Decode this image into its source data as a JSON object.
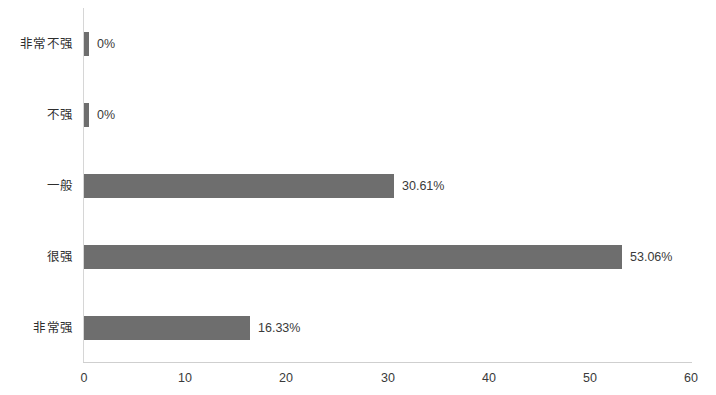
{
  "chart_data": {
    "type": "bar",
    "orientation": "horizontal",
    "title": "",
    "subtitle": "",
    "xlabel": "",
    "ylabel": "",
    "categories": [
      "非常不强",
      "不强",
      "一般",
      "很强",
      "非常强"
    ],
    "values": [
      0,
      0,
      30.61,
      53.06,
      16.33
    ],
    "value_labels": [
      "0%",
      "0%",
      "30.61%",
      "53.06%",
      "16.33%"
    ],
    "series": [
      {
        "name": "",
        "values": [
          0,
          0,
          30.61,
          53.06,
          16.33
        ]
      }
    ],
    "xlim": [
      0,
      60
    ],
    "xticks": [
      0,
      10,
      20,
      30,
      40,
      50,
      60
    ],
    "xtick_labels": [
      "0",
      "10",
      "20",
      "30",
      "40",
      "50",
      "60"
    ],
    "grid": false,
    "legend": false,
    "legend_position": "none",
    "bar_color": "#6e6e6e",
    "axis_color": "#d6d6d6",
    "text_color": "#3a3a3a",
    "background_color": "#ffffff"
  },
  "axis": {
    "ticks": [
      {
        "label": "0",
        "x": 84
      },
      {
        "label": "10",
        "x": 185
      },
      {
        "label": "20",
        "x": 286
      },
      {
        "label": "30",
        "x": 388
      },
      {
        "label": "40",
        "x": 489
      },
      {
        "label": "50",
        "x": 590
      },
      {
        "label": "60",
        "x": 691
      }
    ]
  },
  "rows": [
    {
      "label": "非常不强",
      "value_label": "0%",
      "bar_width_px": 5,
      "top": 14,
      "bar_top": 32
    },
    {
      "label": "不强",
      "value_label": "0%",
      "bar_width_px": 5,
      "top": 85,
      "bar_top": 103
    },
    {
      "label": "一般",
      "value_label": "30.61%",
      "bar_width_px": 310,
      "top": 156,
      "bar_top": 174
    },
    {
      "label": "很强",
      "value_label": "53.06%",
      "bar_width_px": 538,
      "top": 227,
      "bar_top": 245
    },
    {
      "label": "非常强",
      "value_label": "16.33%",
      "bar_width_px": 166,
      "top": 298,
      "bar_top": 316
    }
  ]
}
